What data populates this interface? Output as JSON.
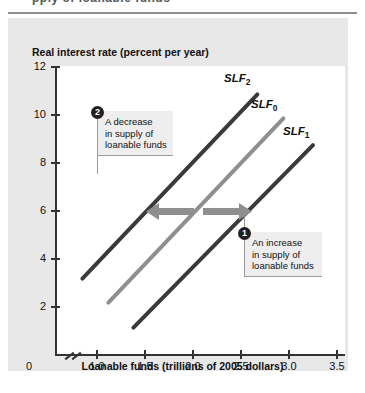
{
  "page": {
    "cut_off_header": "pply of loanable funds",
    "panel_bg": "#e8e8e8",
    "plot_bg": "#ffffff"
  },
  "chart_data": {
    "type": "line",
    "title": "",
    "ylabel": "Real interest rate (percent per year)",
    "xlabel": "Loanable funds (trillions of 2005 dollars)",
    "xlim": [
      0.75,
      3.6
    ],
    "ylim": [
      0,
      12
    ],
    "grid": false,
    "legend": "inline-curve-labels",
    "yticks": [
      "12",
      "10",
      "8",
      "6",
      "4",
      "2",
      "0"
    ],
    "ytick_values": [
      12,
      10,
      8,
      6,
      4,
      2,
      0
    ],
    "xticks": [
      "1.0",
      "1.5",
      "2.0",
      "2.5",
      "3.0",
      "3.5"
    ],
    "xtick_values": [
      1.0,
      1.5,
      2.0,
      2.5,
      3.0,
      3.5
    ],
    "origin_label": "0",
    "axis_break": true,
    "series": [
      {
        "name": "SLF2",
        "label": "SLF",
        "subscript": "2",
        "color": "#3a3a3a",
        "x": [
          1.0,
          2.75
        ],
        "y": [
          3.1,
          10.85
        ]
      },
      {
        "name": "SLF0",
        "label": "SLF",
        "subscript": "0",
        "color": "#8f8f8f",
        "x": [
          1.25,
          3.0
        ],
        "y": [
          2.1,
          9.85
        ]
      },
      {
        "name": "SLF1",
        "label": "SLF",
        "subscript": "1",
        "color": "#3a3a3a",
        "x": [
          1.5,
          3.3
        ],
        "y": [
          1.1,
          8.8
        ]
      }
    ],
    "annotations": [
      {
        "id": "2",
        "badge": "2",
        "text_lines": [
          "A decrease",
          "in supply of",
          "loanable funds"
        ],
        "text": "A decrease in supply of loanable funds"
      },
      {
        "id": "1",
        "badge": "1",
        "text_lines": [
          "An increase",
          "in supply of",
          "loanable funds"
        ],
        "text": "An increase in supply of loanable funds"
      }
    ],
    "shift_arrows": {
      "color": "#8f8f8f",
      "left_arrow_direction": "left",
      "right_arrow_direction": "right",
      "at_interest_rate": 6
    }
  }
}
